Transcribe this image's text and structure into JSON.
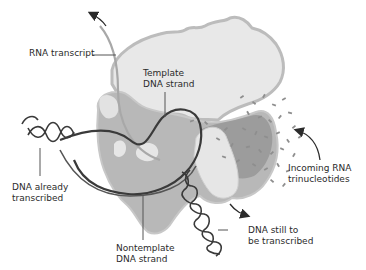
{
  "figure": {
    "caption_partial": "",
    "labels": {
      "rna_transcript": "RNA transcript",
      "template_strand": "Template\nDNA strand",
      "dna_already_transcribed": "DNA already\ntranscribed",
      "nontemplate_strand": "Nontemplate\nDNA strand",
      "incoming_rna": "Incoming RNA\ntrinucleotides",
      "dna_still_to_be_transcribed": "DNA still to\nbe transcribed"
    },
    "colors": {
      "enzyme_light": "#e6e6e6",
      "enzyme_outline": "#bdbdbd",
      "enzyme_mid": "#b5b5b5",
      "enzyme_dark": "#9a9a9a",
      "dna": "#3a3a3a",
      "rna": "#a8a8a8",
      "leader": "#555555",
      "text": "#2b2b2b"
    }
  }
}
